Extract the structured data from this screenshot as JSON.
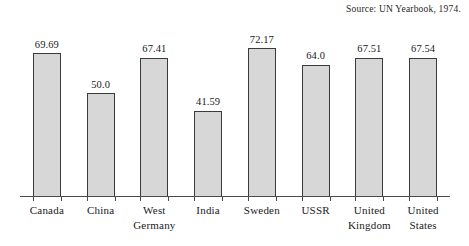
{
  "chart_data": {
    "type": "bar",
    "title": "",
    "subtitle": "",
    "xlabel": "",
    "ylabel": "",
    "source_note": "Source: UN Yearbook, 1974.",
    "grid": false,
    "legend": false,
    "ylim": [
      0,
      72.17
    ],
    "axis_baseline": 0,
    "categories": [
      "Canada",
      "China",
      "West Germany",
      "India",
      "Sweden",
      "USSR",
      "United Kingdom",
      "United States"
    ],
    "category_lines": [
      [
        "Canada"
      ],
      [
        "China"
      ],
      [
        "West",
        "Germany"
      ],
      [
        "India"
      ],
      [
        "Sweden"
      ],
      [
        "USSR"
      ],
      [
        "United",
        "Kingdom"
      ],
      [
        "United",
        "States"
      ]
    ],
    "values": [
      69.69,
      50.0,
      67.41,
      41.59,
      72.17,
      64.0,
      67.51,
      67.54
    ],
    "value_labels": [
      "69.69",
      "50.0",
      "67.41",
      "41.59",
      "72.17",
      "64.0",
      "67.51",
      "67.54"
    ],
    "colors": {
      "bar_fill": "#d7d7d7",
      "bar_border": "#3a3a3a",
      "axis": "#4a4a4a",
      "text": "#1a1a1a",
      "background": "#ffffff"
    }
  }
}
